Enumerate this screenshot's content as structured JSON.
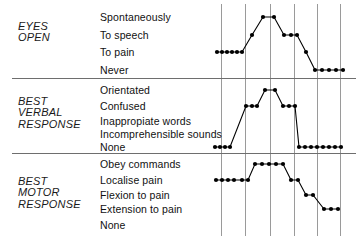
{
  "chart_data": {
    "type": "line",
    "xlabel": "",
    "ylabel": "",
    "grid": true,
    "legend_position": "none",
    "x_gridlines": [
      221,
      245,
      270,
      294,
      317,
      340
    ],
    "sections": [
      {
        "id": "eyes-open",
        "category": "EYES\nOPEN",
        "levels": [
          "Spontaneously",
          "To speech",
          "To pain",
          "Never"
        ],
        "level_y": [
          17,
          35,
          52,
          70
        ],
        "series": [
          {
            "name": "eyes-open-trace",
            "points": [
              {
                "x": 217,
                "level": 2
              },
              {
                "x": 222,
                "level": 2
              },
              {
                "x": 227,
                "level": 2
              },
              {
                "x": 232,
                "level": 2
              },
              {
                "x": 237,
                "level": 2
              },
              {
                "x": 242,
                "level": 2
              },
              {
                "x": 252,
                "level": 1
              },
              {
                "x": 263,
                "level": 0
              },
              {
                "x": 274,
                "level": 0
              },
              {
                "x": 284,
                "level": 1
              },
              {
                "x": 291,
                "level": 1
              },
              {
                "x": 297,
                "level": 1
              },
              {
                "x": 306,
                "level": 2
              },
              {
                "x": 315,
                "level": 3
              },
              {
                "x": 322,
                "level": 3
              },
              {
                "x": 329,
                "level": 3
              },
              {
                "x": 336,
                "level": 3
              },
              {
                "x": 343,
                "level": 3
              }
            ]
          }
        ]
      },
      {
        "id": "best-verbal-response",
        "category": "BEST\nVERBAL\nRESPONSE",
        "levels": [
          "Orientated",
          "Confused",
          "Inappropiate words",
          "Incomprehensible sounds",
          "None"
        ],
        "level_y": [
          90,
          106,
          121,
          134,
          147
        ],
        "series": [
          {
            "name": "verbal-response-trace",
            "points": [
              {
                "x": 215,
                "level": 4
              },
              {
                "x": 220,
                "level": 4
              },
              {
                "x": 225,
                "level": 4
              },
              {
                "x": 230,
                "level": 4
              },
              {
                "x": 246,
                "level": 1
              },
              {
                "x": 252,
                "level": 1
              },
              {
                "x": 257,
                "level": 1
              },
              {
                "x": 265,
                "level": 0
              },
              {
                "x": 275,
                "level": 0
              },
              {
                "x": 283,
                "level": 1
              },
              {
                "x": 289,
                "level": 1
              },
              {
                "x": 295,
                "level": 1
              },
              {
                "x": 299,
                "level": 4
              },
              {
                "x": 305,
                "level": 4
              },
              {
                "x": 311,
                "level": 4
              },
              {
                "x": 317,
                "level": 4
              },
              {
                "x": 323,
                "level": 4
              },
              {
                "x": 329,
                "level": 4
              },
              {
                "x": 335,
                "level": 4
              },
              {
                "x": 341,
                "level": 4
              }
            ]
          }
        ]
      },
      {
        "id": "best-motor-response",
        "category": "BEST\nMOTOR\nRESPONSE",
        "levels": [
          "Obey commands",
          "Localise pain",
          "Flexion to pain",
          "Extension to pain",
          "None"
        ],
        "level_y": [
          164,
          180,
          195,
          209,
          225
        ],
        "series": [
          {
            "name": "motor-response-trace",
            "points": [
              {
                "x": 216,
                "level": 1
              },
              {
                "x": 222,
                "level": 1
              },
              {
                "x": 228,
                "level": 1
              },
              {
                "x": 234,
                "level": 1
              },
              {
                "x": 242,
                "level": 1
              },
              {
                "x": 248,
                "level": 1
              },
              {
                "x": 255,
                "level": 0
              },
              {
                "x": 262,
                "level": 0
              },
              {
                "x": 269,
                "level": 0
              },
              {
                "x": 276,
                "level": 0
              },
              {
                "x": 283,
                "level": 0
              },
              {
                "x": 291,
                "level": 1
              },
              {
                "x": 298,
                "level": 1
              },
              {
                "x": 306,
                "level": 2
              },
              {
                "x": 313,
                "level": 2
              },
              {
                "x": 324,
                "level": 3
              },
              {
                "x": 331,
                "level": 3
              },
              {
                "x": 338,
                "level": 3
              }
            ]
          }
        ]
      }
    ],
    "separators_y": [
      78,
      153
    ]
  },
  "colors": {
    "ink": "#000000",
    "rule": "#6e6e6e",
    "grid": "#9a9a9a",
    "background": "#ffffff"
  }
}
